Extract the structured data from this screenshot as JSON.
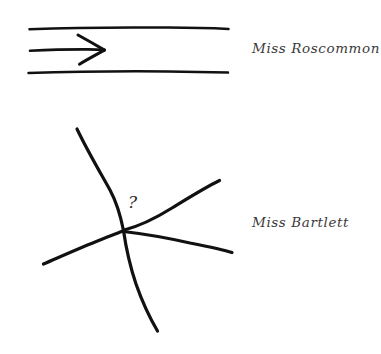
{
  "canvas": {
    "width": 381,
    "height": 354,
    "background_color": "#ffffff",
    "ink_color": "#111111",
    "text_color": "#3b3b3b"
  },
  "figures": {
    "top": {
      "name": "straight-arrow-between-rails",
      "label": "Miss Roscommon",
      "marker": ""
    },
    "bottom": {
      "name": "converging-lines-at-point",
      "label": "Miss Bartlett",
      "marker": "?"
    }
  },
  "labels": {
    "roscommon": "Miss Roscommon",
    "bartlett": "Miss Bartlett"
  },
  "marker": {
    "question": "?"
  }
}
